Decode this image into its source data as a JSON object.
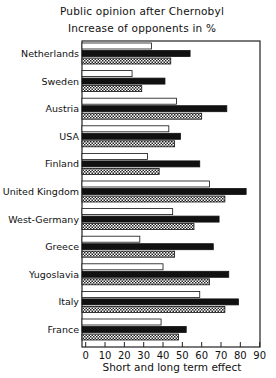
{
  "chart_data": {
    "type": "bar",
    "orientation": "horizontal",
    "title": "Public opinion after Chernobyl",
    "subtitle": "Increase of opponents in %",
    "xlabel": "Short and long term effect",
    "ylabel": "",
    "xlim": [
      0,
      90
    ],
    "xticks": [
      0,
      10,
      20,
      30,
      40,
      50,
      60,
      70,
      80,
      90
    ],
    "grid": false,
    "legend": "none",
    "categories": [
      "Netherlands",
      "Sweden",
      "Austria",
      "USA",
      "Finland",
      "United Kingdom",
      "West-Germany",
      "Greece",
      "Yugoslavia",
      "Italy",
      "France"
    ],
    "series": [
      {
        "name": "white",
        "fill": "#ffffff",
        "values": [
          34,
          24,
          47,
          43,
          32,
          64,
          45,
          28,
          40,
          59,
          39
        ]
      },
      {
        "name": "black",
        "fill": "#111111",
        "values": [
          54,
          41,
          73,
          49,
          59,
          83,
          69,
          66,
          74,
          79,
          52
        ]
      },
      {
        "name": "hatched",
        "fill": "crosshatch",
        "values": [
          44,
          29,
          60,
          46,
          38,
          72,
          56,
          46,
          64,
          72,
          48
        ]
      }
    ]
  }
}
